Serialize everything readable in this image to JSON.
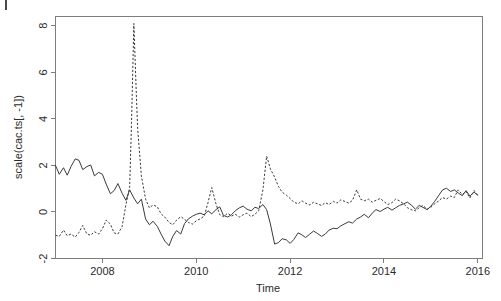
{
  "figure": {
    "background_color": "#ffffff",
    "frame_color": "#7d7d7d",
    "line_color": "#3a3a3a",
    "corner_mark_label": "crop-mark"
  },
  "chart_data": {
    "type": "line",
    "title": "",
    "xlabel": "Time",
    "ylabel": "scale(cac.ts[, -1])",
    "xlim": [
      2007.0,
      2016.1
    ],
    "ylim": [
      -2.0,
      8.4
    ],
    "xticks": [
      2008,
      2010,
      2012,
      2014,
      2016
    ],
    "xtick_labels": [
      "2008",
      "2010",
      "2012",
      "2014",
      "2016"
    ],
    "yticks": [
      -2,
      0,
      2,
      4,
      6,
      8
    ],
    "ytick_labels": [
      "-2",
      "0",
      "2",
      "4",
      "6",
      "8"
    ],
    "grid": false,
    "legend": "none",
    "series": [
      {
        "name": "solid-series",
        "style": "solid",
        "color": "#3a3a3a",
        "x": [
          2007.0,
          2007.08,
          2007.17,
          2007.25,
          2007.33,
          2007.42,
          2007.5,
          2007.58,
          2007.67,
          2007.75,
          2007.83,
          2007.92,
          2008.0,
          2008.08,
          2008.17,
          2008.25,
          2008.33,
          2008.42,
          2008.5,
          2008.58,
          2008.67,
          2008.75,
          2008.83,
          2008.92,
          2009.0,
          2009.08,
          2009.17,
          2009.25,
          2009.33,
          2009.42,
          2009.5,
          2009.58,
          2009.67,
          2009.75,
          2009.83,
          2009.92,
          2010.0,
          2010.08,
          2010.17,
          2010.25,
          2010.33,
          2010.42,
          2010.5,
          2010.58,
          2010.67,
          2010.75,
          2010.83,
          2010.92,
          2011.0,
          2011.08,
          2011.17,
          2011.25,
          2011.33,
          2011.42,
          2011.5,
          2011.58,
          2011.67,
          2011.75,
          2011.83,
          2011.92,
          2012.0,
          2012.08,
          2012.17,
          2012.25,
          2012.33,
          2012.42,
          2012.5,
          2012.58,
          2012.67,
          2012.75,
          2012.83,
          2012.92,
          2013.0,
          2013.08,
          2013.17,
          2013.25,
          2013.33,
          2013.42,
          2013.5,
          2013.58,
          2013.67,
          2013.75,
          2013.83,
          2013.92,
          2014.0,
          2014.08,
          2014.17,
          2014.25,
          2014.33,
          2014.42,
          2014.5,
          2014.58,
          2014.67,
          2014.75,
          2014.83,
          2014.92,
          2015.0,
          2015.08,
          2015.17,
          2015.25,
          2015.33,
          2015.42,
          2015.5,
          2015.58,
          2015.67,
          2015.75,
          2015.83,
          2015.92,
          2016.0
        ],
        "y": [
          2.0,
          1.62,
          1.9,
          1.58,
          1.95,
          2.28,
          2.22,
          1.82,
          1.95,
          2.02,
          1.55,
          1.7,
          1.62,
          1.2,
          0.78,
          0.92,
          1.22,
          0.8,
          0.5,
          0.95,
          0.6,
          0.35,
          0.55,
          -0.3,
          -0.55,
          -0.4,
          -0.62,
          -0.95,
          -1.25,
          -1.45,
          -1.05,
          -0.8,
          -0.95,
          -0.5,
          -0.3,
          -0.18,
          -0.1,
          -0.05,
          -0.12,
          0.05,
          -0.08,
          0.1,
          0.22,
          -0.15,
          -0.22,
          -0.12,
          0.05,
          0.18,
          0.25,
          0.12,
          0.05,
          0.2,
          0.15,
          0.32,
          0.1,
          -0.52,
          -1.38,
          -1.32,
          -1.15,
          -1.2,
          -1.35,
          -1.18,
          -0.9,
          -0.98,
          -1.1,
          -0.95,
          -0.82,
          -0.92,
          -1.05,
          -0.95,
          -0.78,
          -0.7,
          -0.72,
          -0.6,
          -0.5,
          -0.42,
          -0.48,
          -0.3,
          -0.22,
          -0.1,
          -0.25,
          -0.05,
          0.1,
          0.02,
          0.12,
          0.2,
          0.08,
          0.18,
          0.28,
          0.35,
          0.42,
          0.3,
          0.12,
          0.28,
          0.2,
          0.1,
          0.25,
          0.45,
          0.72,
          0.95,
          1.02,
          0.88,
          0.95,
          0.82,
          0.7,
          0.92,
          0.68,
          0.85,
          0.72
        ]
      },
      {
        "name": "dashed-series",
        "style": "dashed",
        "color": "#3a3a3a",
        "x": [
          2007.0,
          2007.08,
          2007.17,
          2007.25,
          2007.33,
          2007.42,
          2007.5,
          2007.58,
          2007.67,
          2007.75,
          2007.83,
          2007.92,
          2008.0,
          2008.08,
          2008.17,
          2008.25,
          2008.33,
          2008.42,
          2008.5,
          2008.58,
          2008.62,
          2008.67,
          2008.72,
          2008.75,
          2008.83,
          2008.92,
          2009.0,
          2009.08,
          2009.17,
          2009.25,
          2009.33,
          2009.42,
          2009.5,
          2009.58,
          2009.67,
          2009.75,
          2009.83,
          2009.92,
          2010.0,
          2010.08,
          2010.17,
          2010.25,
          2010.33,
          2010.42,
          2010.5,
          2010.58,
          2010.67,
          2010.75,
          2010.83,
          2010.92,
          2011.0,
          2011.08,
          2011.17,
          2011.25,
          2011.33,
          2011.42,
          2011.5,
          2011.58,
          2011.67,
          2011.75,
          2011.83,
          2011.92,
          2012.0,
          2012.08,
          2012.17,
          2012.25,
          2012.33,
          2012.42,
          2012.5,
          2012.58,
          2012.67,
          2012.75,
          2012.83,
          2012.92,
          2013.0,
          2013.08,
          2013.17,
          2013.25,
          2013.33,
          2013.42,
          2013.5,
          2013.58,
          2013.67,
          2013.75,
          2013.83,
          2013.92,
          2014.0,
          2014.08,
          2014.17,
          2014.25,
          2014.33,
          2014.42,
          2014.5,
          2014.58,
          2014.67,
          2014.75,
          2014.83,
          2014.92,
          2015.0,
          2015.08,
          2015.17,
          2015.25,
          2015.33,
          2015.42,
          2015.5,
          2015.58,
          2015.67,
          2015.75,
          2015.83,
          2015.92,
          2016.0
        ],
        "y": [
          -1.0,
          -1.05,
          -0.78,
          -1.02,
          -0.95,
          -1.08,
          -0.88,
          -0.58,
          -0.95,
          -1.0,
          -0.85,
          -0.95,
          -0.72,
          -0.35,
          -0.52,
          -0.9,
          -0.95,
          -0.62,
          0.3,
          1.05,
          3.8,
          8.1,
          5.2,
          3.6,
          1.55,
          0.55,
          0.18,
          0.3,
          0.22,
          -0.08,
          -0.22,
          -0.45,
          -0.55,
          -0.35,
          -0.2,
          -0.32,
          -0.45,
          -0.52,
          -0.38,
          -0.3,
          -0.18,
          0.4,
          1.05,
          0.35,
          -0.12,
          -0.2,
          -0.05,
          -0.18,
          -0.1,
          -0.22,
          -0.12,
          -0.05,
          -0.2,
          -0.1,
          0.05,
          0.95,
          2.4,
          1.85,
          1.5,
          1.1,
          0.85,
          0.72,
          0.58,
          0.42,
          0.35,
          0.48,
          0.38,
          0.3,
          0.42,
          0.35,
          0.28,
          0.4,
          0.32,
          0.45,
          0.38,
          0.52,
          0.45,
          0.38,
          0.5,
          0.95,
          0.55,
          0.48,
          0.55,
          0.42,
          0.5,
          0.58,
          0.45,
          0.32,
          0.4,
          0.55,
          0.48,
          0.35,
          0.18,
          0.1,
          0.05,
          0.18,
          0.28,
          0.12,
          0.2,
          0.35,
          0.48,
          0.62,
          0.55,
          0.68,
          0.62,
          0.95,
          0.75,
          0.88,
          0.6,
          0.92,
          0.7
        ]
      }
    ]
  }
}
